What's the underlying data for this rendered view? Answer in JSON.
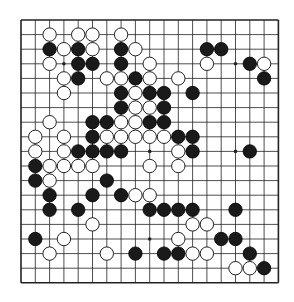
{
  "header": {
    "caption": ""
  },
  "board": {
    "size": 19,
    "origin_x": 21,
    "origin_y": 20,
    "spacing_x": 14.3,
    "spacing_y": 14.6,
    "line_color": "#222222",
    "background": "#ffffff",
    "star_points": [
      [
        3,
        3
      ],
      [
        3,
        9
      ],
      [
        3,
        15
      ],
      [
        9,
        3
      ],
      [
        9,
        9
      ],
      [
        9,
        15
      ],
      [
        15,
        3
      ],
      [
        15,
        9
      ],
      [
        15,
        15
      ]
    ],
    "black_stones": [
      [
        2,
        2
      ],
      [
        2,
        4
      ],
      [
        2,
        7
      ],
      [
        2,
        13
      ],
      [
        2,
        14
      ],
      [
        3,
        4
      ],
      [
        3,
        5
      ],
      [
        3,
        7
      ],
      [
        3,
        16
      ],
      [
        4,
        4
      ],
      [
        4,
        8
      ],
      [
        4,
        17
      ],
      [
        5,
        7
      ],
      [
        5,
        9
      ],
      [
        5,
        10
      ],
      [
        5,
        12
      ],
      [
        6,
        7
      ],
      [
        6,
        10
      ],
      [
        7,
        5
      ],
      [
        7,
        6
      ],
      [
        7,
        9
      ],
      [
        7,
        10
      ],
      [
        8,
        5
      ],
      [
        8,
        11
      ],
      [
        8,
        12
      ],
      [
        9,
        4
      ],
      [
        9,
        5
      ],
      [
        9,
        6
      ],
      [
        9,
        7
      ],
      [
        9,
        12
      ],
      [
        9,
        16
      ],
      [
        10,
        1
      ],
      [
        11,
        1
      ],
      [
        11,
        6
      ],
      [
        12,
        2
      ],
      [
        12,
        5
      ],
      [
        12,
        7
      ],
      [
        13,
        2
      ],
      [
        13,
        4
      ],
      [
        13,
        9
      ],
      [
        13,
        10
      ],
      [
        13,
        11
      ],
      [
        13,
        12
      ],
      [
        13,
        15
      ],
      [
        15,
        1
      ],
      [
        15,
        14
      ],
      [
        15,
        15
      ],
      [
        16,
        8
      ],
      [
        16,
        10
      ],
      [
        16,
        11
      ],
      [
        16,
        16
      ],
      [
        17,
        17
      ]
    ],
    "white_stones": [
      [
        1,
        2
      ],
      [
        1,
        4
      ],
      [
        1,
        5
      ],
      [
        1,
        7
      ],
      [
        2,
        3
      ],
      [
        2,
        5
      ],
      [
        2,
        8
      ],
      [
        3,
        2
      ],
      [
        3,
        9
      ],
      [
        3,
        13
      ],
      [
        3,
        17
      ],
      [
        4,
        3
      ],
      [
        4,
        6
      ],
      [
        4,
        7
      ],
      [
        4,
        9
      ],
      [
        4,
        11
      ],
      [
        5,
        3
      ],
      [
        5,
        8
      ],
      [
        6,
        8
      ],
      [
        6,
        9
      ],
      [
        7,
        2
      ],
      [
        7,
        7
      ],
      [
        7,
        8
      ],
      [
        8,
        1
      ],
      [
        8,
        3
      ],
      [
        8,
        6
      ],
      [
        8,
        7
      ],
      [
        8,
        8
      ],
      [
        8,
        9
      ],
      [
        8,
        10
      ],
      [
        9,
        1
      ],
      [
        9,
        3
      ],
      [
        9,
        11
      ],
      [
        10,
        2
      ],
      [
        10,
        3
      ],
      [
        10,
        4
      ],
      [
        10,
        5
      ],
      [
        10,
        9
      ],
      [
        10,
        11
      ],
      [
        11,
        2
      ],
      [
        12,
        8
      ],
      [
        12,
        9
      ],
      [
        14,
        5
      ],
      [
        14,
        12
      ],
      [
        14,
        13
      ],
      [
        15,
        3
      ],
      [
        15,
        11
      ],
      [
        16,
        2
      ],
      [
        16,
        6
      ],
      [
        16,
        12
      ],
      [
        16,
        13
      ],
      [
        17,
        15
      ],
      [
        17,
        16
      ]
    ]
  }
}
